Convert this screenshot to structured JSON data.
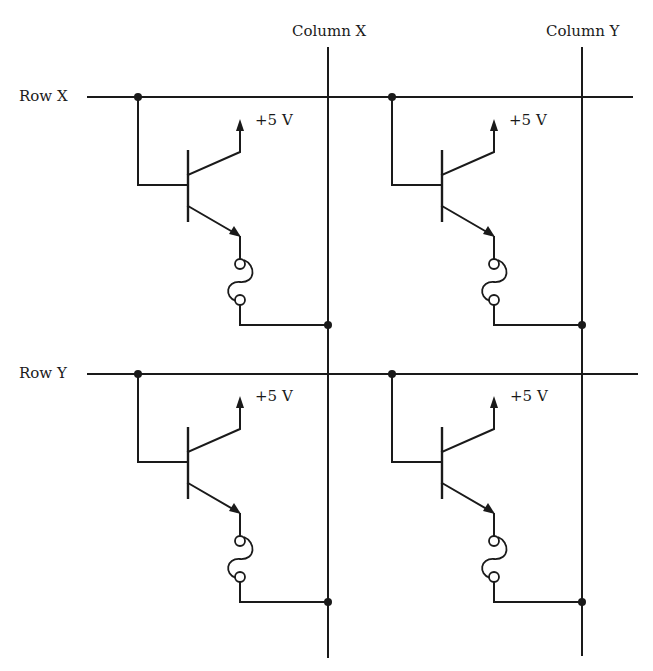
{
  "diagram": {
    "type": "memory-cell-array-schematic",
    "rows": [
      {
        "label": "Row X"
      },
      {
        "label": "Row Y"
      }
    ],
    "columns": [
      {
        "label": "Column X"
      },
      {
        "label": "Column Y"
      }
    ],
    "cells": [
      {
        "row": "Row X",
        "column": "Column X",
        "supply_label": "+5 V",
        "components": [
          "transistor",
          "fuse"
        ]
      },
      {
        "row": "Row X",
        "column": "Column Y",
        "supply_label": "+5 V",
        "components": [
          "transistor",
          "fuse"
        ]
      },
      {
        "row": "Row Y",
        "column": "Column X",
        "supply_label": "+5 V",
        "components": [
          "transistor",
          "fuse"
        ]
      },
      {
        "row": "Row Y",
        "column": "Column Y",
        "supply_label": "+5 V",
        "components": [
          "transistor",
          "fuse"
        ]
      }
    ],
    "colors": {
      "line": "#1a1a1a",
      "background": "#ffffff"
    }
  }
}
